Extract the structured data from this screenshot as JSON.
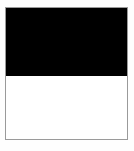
{
  "page": {
    "width": 134,
    "height": 151,
    "background_color": "#fefefe",
    "has_text": false,
    "has_icons": false
  },
  "swatch": {
    "name": "two-tone-swatch",
    "border_color": "#9a9a9a",
    "border_width_px": 1,
    "x": 5,
    "y": 7,
    "width": 123,
    "height": 133,
    "bands": [
      {
        "id": "top",
        "name": "upper-band",
        "color": "#000000",
        "color_label": "black",
        "height_px": 68,
        "share_percent": 51
      },
      {
        "id": "bottom",
        "name": "lower-band",
        "color": "#ffffff",
        "color_label": "white",
        "height_px": 64,
        "share_percent": 49
      }
    ],
    "divider_y_px": 75
  }
}
